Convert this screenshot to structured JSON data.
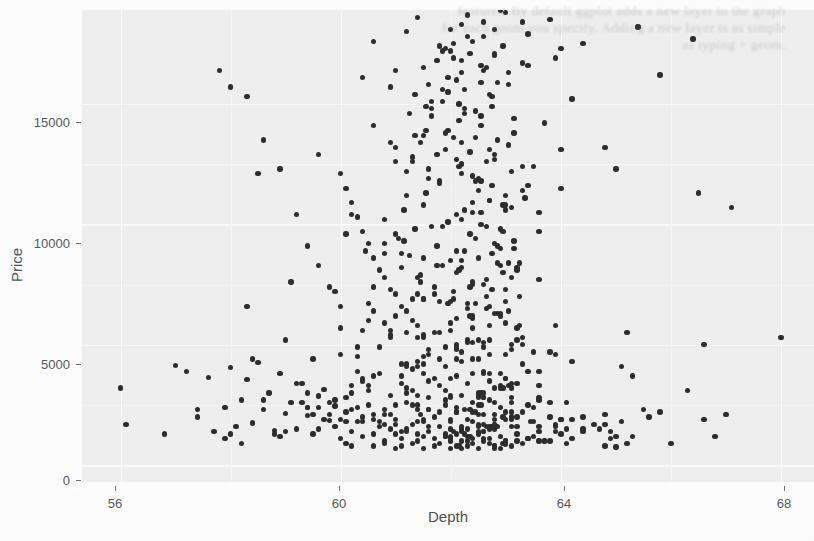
{
  "figure": {
    "kind": "scatter-plot",
    "background_color": "#fdfdfd",
    "panel_color": "#efefef",
    "point_color": "#2e2e2e",
    "gridline_color": "#fafafa",
    "axis_text_color": "#555a5e",
    "bleed_through_lines": [
      "features.  By  default  ggplot  adds  a  new  layer  to  the  graph",
      "for  each  geom  you  specify.  Adding  a  new  layer  is  as  simple",
      "as  typing  +  geom."
    ]
  },
  "chart_data": {
    "type": "scatter",
    "title": "",
    "subtitle": "",
    "xlabel": "Depth",
    "ylabel": "Price",
    "xlim": [
      55.3,
      68.6
    ],
    "ylim": [
      -700,
      18900
    ],
    "xticks": [
      56,
      60,
      64,
      68
    ],
    "xtick_labels": [
      "56",
      "60",
      "64",
      "68"
    ],
    "yticks": [
      0,
      5000,
      10000,
      15000
    ],
    "ytick_labels": [
      "0",
      "5000",
      "10000",
      "15000"
    ],
    "grid": true,
    "legend": "none",
    "n_points": 571,
    "point_size": 5.4,
    "series_name": "diamonds",
    "x": [
      56.0,
      56.1,
      57.0,
      57.2,
      57.4,
      57.6,
      57.7,
      57.9,
      58.0,
      58.1,
      58.2,
      58.3,
      58.4,
      58.5,
      58.6,
      58.7,
      58.8,
      58.9,
      59.0,
      59.0,
      59.1,
      59.2,
      59.3,
      59.4,
      59.5,
      59.5,
      59.6,
      59.7,
      59.8,
      59.9,
      57.8,
      58.0,
      58.3,
      58.6,
      58.9,
      59.2,
      59.4,
      59.6,
      59.8,
      60.0,
      60.0,
      60.1,
      60.1,
      60.2,
      60.2,
      60.3,
      60.3,
      60.4,
      60.4,
      60.5,
      60.5,
      60.6,
      60.6,
      60.7,
      60.7,
      60.8,
      60.8,
      60.9,
      60.9,
      61.0,
      60.0,
      60.2,
      60.4,
      60.6,
      60.8,
      61.0,
      61.2,
      61.4,
      60.1,
      60.3,
      60.5,
      60.7,
      60.9,
      61.1,
      61.3,
      61.5,
      61.0,
      61.0,
      61.1,
      61.1,
      61.1,
      61.2,
      61.2,
      61.2,
      61.3,
      61.3,
      61.3,
      61.4,
      61.4,
      61.4,
      61.5,
      61.5,
      61.5,
      61.6,
      61.6,
      61.6,
      61.7,
      61.7,
      61.7,
      61.8,
      61.8,
      61.8,
      61.9,
      61.9,
      61.9,
      62.0,
      62.0,
      62.0,
      62.0,
      62.1,
      62.1,
      62.1,
      62.1,
      62.2,
      62.2,
      62.2,
      62.2,
      62.3,
      62.3,
      62.3,
      62.3,
      62.4,
      62.4,
      62.4,
      62.4,
      62.5,
      62.5,
      62.5,
      62.5,
      62.6,
      62.6,
      62.6,
      62.6,
      62.7,
      62.7,
      62.7,
      62.7,
      62.8,
      62.8,
      62.8,
      62.9,
      62.9,
      62.9,
      63.0,
      63.0,
      63.0,
      63.1,
      63.1,
      63.2,
      63.2,
      63.3,
      63.3,
      63.4,
      63.5,
      63.6,
      63.7,
      61.0,
      61.2,
      61.4,
      61.6,
      61.8,
      62.0,
      62.2,
      62.4,
      62.6,
      62.8,
      63.0,
      63.2,
      63.4,
      61.1,
      61.3,
      61.5,
      61.7,
      61.9,
      62.1,
      62.3,
      62.5,
      62.7,
      62.9,
      63.1,
      63.3,
      61.05,
      61.25,
      61.45,
      61.65,
      61.85,
      62.05,
      62.25,
      62.45,
      62.65,
      62.85,
      63.05,
      63.25,
      61.15,
      61.35,
      61.55,
      61.75,
      61.95,
      62.15,
      62.35,
      62.55,
      62.75,
      62.95,
      63.15,
      63.35,
      60.2,
      60.5,
      60.8,
      61.1,
      61.4,
      61.7,
      62.0,
      62.3,
      62.6,
      62.9,
      63.2,
      63.5,
      63.8,
      64.1,
      60.3,
      60.6,
      60.9,
      61.2,
      61.5,
      61.8,
      62.1,
      62.4,
      62.7,
      63.0,
      63.3,
      63.6,
      63.9,
      59.2,
      59.6,
      60.0,
      60.4,
      60.8,
      61.2,
      61.6,
      62.0,
      62.4,
      62.8,
      63.2,
      63.6,
      64.0,
      64.4,
      61.0,
      61.3,
      61.6,
      61.9,
      62.2,
      62.5,
      62.8,
      63.1,
      63.4,
      60.6,
      60.9,
      61.2,
      61.5,
      61.8,
      62.1,
      62.4,
      62.7,
      63.0,
      63.3,
      63.6,
      61.25,
      61.55,
      61.85,
      62.15,
      62.45,
      62.75,
      63.05,
      61.35,
      61.65,
      61.95,
      62.25,
      62.55,
      62.85,
      63.15,
      62.0,
      62.2,
      62.4,
      62.6,
      62.8,
      61.8,
      62.05,
      62.3,
      62.55,
      62.8,
      63.05,
      60.0,
      60.3,
      60.6,
      60.9,
      61.2,
      61.5,
      61.8,
      62.1,
      62.4,
      62.7,
      63.0,
      63.3,
      63.6,
      63.9,
      64.2,
      61.4,
      61.7,
      62.0,
      62.3,
      62.6,
      62.9,
      63.2,
      60.8,
      61.1,
      61.45,
      61.75,
      62.05,
      62.35,
      62.65,
      62.95,
      63.25,
      58.9,
      59.4,
      59.9,
      60.4,
      60.9,
      61.4,
      61.9,
      62.4,
      62.9,
      63.4,
      63.9,
      64.4,
      64.9,
      60.1,
      60.45,
      60.8,
      61.15,
      61.5,
      61.85,
      62.2,
      62.55,
      62.9,
      63.25,
      63.6,
      61.2,
      61.5,
      61.8,
      62.1,
      62.4,
      62.7,
      63.0,
      63.3,
      59.6,
      60.1,
      60.6,
      61.1,
      61.6,
      62.1,
      62.6,
      63.1,
      63.6,
      64.1,
      64.6,
      61.3,
      61.6,
      61.9,
      62.2,
      62.5,
      62.8,
      63.1,
      61.45,
      61.75,
      62.05,
      62.35,
      62.65,
      62.95,
      60.5,
      61.0,
      61.5,
      62.0,
      62.5,
      63.0,
      63.5,
      64.0,
      59.9,
      60.7,
      61.3,
      61.9,
      62.5,
      63.1,
      63.7,
      61.35,
      61.65,
      61.95,
      62.25,
      62.55,
      62.85,
      63.15,
      63.45,
      60.2,
      60.8,
      61.4,
      62.0,
      62.6,
      63.2,
      63.8,
      64.4,
      59.3,
      60.0,
      60.7,
      61.4,
      62.1,
      62.8,
      63.5,
      64.2,
      61.55,
      61.85,
      62.15,
      62.45,
      62.75,
      63.05,
      61.65,
      61.95,
      62.25,
      62.55,
      62.85,
      58.6,
      59.5,
      60.4,
      61.3,
      62.2,
      63.1,
      64.0,
      64.9,
      65.8,
      60.9,
      61.5,
      62.1,
      62.7,
      63.3,
      63.9,
      60.4,
      61.0,
      61.6,
      62.2,
      62.8,
      63.4,
      64.0,
      61.75,
      62.05,
      62.35,
      62.65,
      62.95,
      61.85,
      62.2,
      62.5,
      62.8,
      63.1,
      57.4,
      58.4,
      59.4,
      60.4,
      61.4,
      62.4,
      63.4,
      64.4,
      65.4,
      66.4,
      61.2,
      61.9,
      62.6,
      63.3,
      60.6,
      61.4,
      62.2,
      63.0,
      63.8,
      62.0,
      62.3,
      62.6,
      62.9,
      61.9,
      62.25,
      62.6,
      62.95,
      59.8,
      60.9,
      62.0,
      63.1,
      64.2,
      65.3,
      60.3,
      61.5,
      62.7,
      63.9,
      65.1,
      61.6,
      62.1,
      62.6,
      63.1,
      63.6,
      61.45,
      62.0,
      62.55,
      63.1,
      56.8,
      58.2,
      59.6,
      61.0,
      62.4,
      63.8,
      65.2,
      66.6,
      68.0,
      62.1,
      62.4,
      62.7,
      63.0,
      62.0,
      62.35,
      62.7,
      63.05,
      60.5,
      61.7,
      62.9,
      64.1,
      59.7,
      61.1,
      62.5,
      63.9,
      65.3,
      62.15,
      62.45,
      62.75,
      63.05,
      61.95,
      62.3,
      62.65,
      63.0,
      58.3,
      59.9,
      61.5,
      63.1,
      64.7,
      66.3,
      60.1,
      61.9,
      63.7,
      65.5,
      62.2,
      62.5,
      62.8,
      62.05,
      62.4,
      62.75,
      63.1,
      59.1,
      60.6,
      62.1,
      63.6,
      65.1,
      58.0,
      59.8,
      61.6,
      63.4,
      65.2,
      67.0,
      62.3,
      62.6,
      62.9,
      62.15,
      62.5,
      62.85,
      63.2,
      60.8,
      62.2,
      63.6,
      65.0,
      59.4,
      61.2,
      63.0,
      64.8,
      66.6,
      62.25,
      62.55,
      62.85,
      62.1,
      62.45,
      62.8,
      63.15,
      61.0,
      62.6,
      64.2,
      65.8,
      58.8,
      60.8,
      62.8,
      64.8,
      66.8,
      62.35,
      62.65,
      62.95,
      62.2,
      62.55,
      62.9,
      60.2,
      62.0,
      63.8,
      65.6,
      57.9,
      60.2,
      62.5,
      64.8,
      67.1,
      62.4,
      62.7,
      63.0,
      62.25,
      62.6,
      62.95,
      61.4,
      63.2,
      65.0,
      59.0,
      61.5,
      64.0,
      66.5,
      62.45,
      62.75,
      62.3,
      62.65,
      63.0,
      60.6,
      62.8,
      65.0,
      58.5,
      61.0,
      63.5,
      66.0,
      62.5,
      62.8,
      62.35,
      62.7,
      61.8,
      64.0,
      59.6,
      62.2,
      64.8,
      62.55,
      62.85,
      62.4,
      62.75,
      60.4,
      63.0,
      58.2,
      61.4,
      64.6,
      67.8,
      62.6,
      62.9,
      62.45,
      62.8
    ],
    "y": [
      3200,
      1700,
      4150,
      3900,
      2000,
      3650,
      1400,
      2400,
      4050,
      1600,
      2700,
      3550,
      1750,
      4250,
      2300,
      3000,
      1450,
      3800,
      2150,
      5200,
      2600,
      1500,
      3400,
      2050,
      4400,
      1300,
      2850,
      3150,
      1850,
      2450,
      16400,
      15700,
      15300,
      13500,
      12300,
      10400,
      9100,
      8300,
      7400,
      6600,
      1100,
      2200,
      900,
      3300,
      1400,
      4500,
      1800,
      5600,
      1200,
      6700,
      2500,
      800,
      3700,
      1600,
      4900,
      2100,
      1000,
      5400,
      2900,
      1300,
      12100,
      10900,
      9700,
      8600,
      7800,
      7100,
      6400,
      5800,
      11500,
      10300,
      9200,
      8100,
      7300,
      6600,
      6000,
      5300,
      700,
      1900,
      1100,
      3400,
      800,
      2600,
      1500,
      4200,
      900,
      3100,
      1700,
      5300,
      1000,
      2300,
      1200,
      3800,
      700,
      2800,
      1400,
      4600,
      800,
      2000,
      1100,
      3300,
      900,
      1600,
      2500,
      1200,
      4100,
      700,
      1800,
      1000,
      3600,
      1300,
      2200,
      800,
      5000,
      1500,
      1000,
      2900,
      700,
      1900,
      1200,
      3400,
      800,
      2600,
      1100,
      4400,
      900,
      1700,
      1300,
      3000,
      700,
      2100,
      1000,
      3800,
      1400,
      1600,
      900,
      2700,
      1100,
      800,
      3200,
      1500,
      700,
      2400,
      1200,
      1900,
      1000,
      3600,
      800,
      2800,
      1300,
      1600,
      900,
      2200,
      1100,
      1800,
      1400,
      1000,
      6200,
      5500,
      7100,
      4800,
      6800,
      5900,
      4300,
      7600,
      5100,
      6300,
      4600,
      5700,
      3900,
      8200,
      6900,
      5400,
      7400,
      4900,
      6100,
      5200,
      4400,
      6600,
      3800,
      5000,
      4200,
      9400,
      8700,
      7900,
      9900,
      8300,
      7200,
      8900,
      6700,
      7700,
      6300,
      8400,
      5800,
      10600,
      9800,
      11300,
      9100,
      10100,
      12400,
      9600,
      11800,
      8800,
      10800,
      9300,
      11100,
      2300,
      3100,
      1700,
      4200,
      2500,
      3600,
      1900,
      5100,
      2800,
      3300,
      2000,
      4700,
      2600,
      1500,
      3900,
      2100,
      5600,
      3000,
      1800,
      4400,
      2400,
      6200,
      3500,
      2200,
      5300,
      2700,
      1600,
      3400,
      2900,
      4600,
      2000,
      5900,
      3200,
      2300,
      6800,
      3800,
      2600,
      5200,
      2800,
      1900,
      1400,
      13200,
      12600,
      11900,
      13800,
      12100,
      11400,
      12900,
      10700,
      11600,
      14100,
      13400,
      12200,
      13700,
      11800,
      12700,
      10900,
      13100,
      11200,
      12400,
      10500,
      14600,
      13900,
      15100,
      14300,
      13600,
      14900,
      13300,
      15400,
      14800,
      16100,
      15600,
      14500,
      15900,
      13800,
      17200,
      16800,
      17600,
      16400,
      18100,
      17400,
      16900,
      17800,
      16600,
      17100,
      16300,
      5700,
      4900,
      6400,
      5300,
      4100,
      6900,
      5500,
      3700,
      6100,
      4600,
      7300,
      5000,
      3300,
      5800,
      4300,
      7800,
      7100,
      8500,
      6700,
      7500,
      6200,
      8100,
      9200,
      8800,
      7600,
      8300,
      6900,
      7400,
      6500,
      8000,
      7000,
      1200,
      2400,
      1600,
      3500,
      2100,
      4300,
      2700,
      1800,
      3200,
      2500,
      1400,
      2000,
      1100,
      9600,
      8900,
      10200,
      9300,
      8600,
      9900,
      8200,
      10500,
      9000,
      8400,
      9700,
      11200,
      10800,
      11700,
      10400,
      12000,
      11000,
      10600,
      11400,
      1500,
      2800,
      1900,
      3700,
      2300,
      4800,
      3000,
      2200,
      3900,
      2600,
      1700,
      12800,
      12300,
      13100,
      12500,
      11900,
      12700,
      12200,
      13400,
      12900,
      13600,
      13000,
      12600,
      2000,
      3300,
      2500,
      4500,
      2900,
      5200,
      3600,
      2400,
      1300,
      2700,
      1800,
      4000,
      3100,
      2100,
      1600,
      14200,
      13700,
      14500,
      13900,
      14800,
      14100,
      13500,
      14400,
      1800,
      3000,
      2300,
      4100,
      2800,
      4900,
      3400,
      2000,
      1500,
      2600,
      1900,
      3800,
      2900,
      2200,
      1700,
      1200,
      15200,
      14900,
      15600,
      15000,
      14700,
      15300,
      15800,
      15100,
      15500,
      14600,
      15900,
      1600,
      2700,
      2100,
      3600,
      2500,
      4700,
      3200,
      1900,
      1400,
      16200,
      15700,
      16500,
      16000,
      15400,
      16700,
      16900,
      16100,
      16400,
      15800,
      16300,
      17000,
      16600,
      17300,
      16800,
      17500,
      17100,
      16500,
      17400,
      17200,
      1400,
      2500,
      1900,
      3400,
      2300,
      4400,
      3000,
      1800,
      1300,
      2200,
      17900,
      17500,
      18200,
      17700,
      18000,
      17300,
      17800,
      18400,
      17600,
      18600,
      18300,
      18800,
      18500,
      18100,
      18700,
      18400,
      18900,
      1200,
      2300,
      1700,
      3200,
      2100,
      1500,
      1100,
      2600,
      1900,
      3700,
      2400,
      4200,
      3800,
      4600,
      4100,
      3500,
      4400,
      3900,
      4800,
      1000,
      2100,
      1500,
      3000,
      1900,
      1300,
      900,
      2400,
      1700,
      5100,
      4700,
      5500,
      5000,
      5300,
      4900,
      5700,
      5200,
      5900,
      5600,
      6200,
      5800,
      6400,
      6000,
      5500,
      6300,
      900,
      1900,
      1400,
      2800,
      1700,
      1200,
      800,
      2200,
      1600,
      3300,
      6700,
      6500,
      7000,
      6800,
      6600,
      7200,
      6900,
      2000,
      1500,
      3100,
      1800,
      1300,
      1000,
      2300,
      1600,
      2900,
      2100,
      1400,
      7500,
      7300,
      7800,
      7600,
      7400,
      8000,
      7700,
      1800,
      1300,
      2600,
      1600,
      1100,
      900,
      2100,
      1500,
      2800,
      8300,
      8100,
      8600,
      8400,
      8200,
      8800,
      8500,
      1600,
      1200,
      2400,
      1400,
      1000,
      800,
      1900,
      1300,
      2500,
      9100,
      8900,
      9400,
      9200,
      9000,
      9600,
      1400,
      1100,
      2200,
      1300,
      900,
      700,
      1700,
      1200,
      2300,
      9900,
      9700,
      10200,
      10000,
      9800,
      10400,
      1200,
      1000,
      2000,
      1100,
      800,
      1600,
      2100,
      10700,
      10500,
      11000,
      10800,
      10600,
      1100,
      900,
      1800,
      1000,
      750,
      1400,
      1900,
      11500,
      11300,
      11800,
      11600,
      1000,
      1600,
      850,
      1300,
      1700,
      12300,
      12100,
      12600,
      12400,
      900,
      1400,
      800,
      1200,
      1500,
      2200,
      13100,
      12900,
      13400,
      13200
    ]
  },
  "axes": {
    "x_title": "Depth",
    "y_title": "Price",
    "x_ticks": [
      {
        "label": "56",
        "left_px": 115
      },
      {
        "label": "60",
        "left_px": 339
      },
      {
        "label": "64",
        "left_px": 564
      },
      {
        "label": "68",
        "left_px": 784
      }
    ],
    "y_ticks": [
      {
        "label": "15000",
        "top_px": 122
      },
      {
        "label": "10000",
        "top_px": 243
      },
      {
        "label": "5000",
        "top_px": 364
      },
      {
        "label": "0",
        "top_px": 480
      }
    ]
  }
}
